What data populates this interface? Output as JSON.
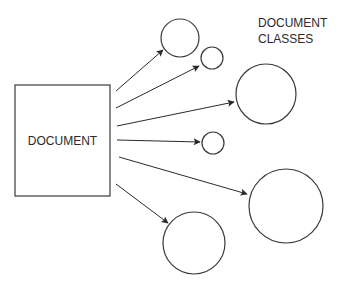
{
  "diagram": {
    "source_node": {
      "label": "DOCUMENT",
      "x": 15,
      "y": 85,
      "width": 95,
      "height": 111
    },
    "classes_title": {
      "line1": "DOCUMENT",
      "line2": "CLASSES"
    },
    "classes": [
      {
        "id": "A",
        "cx": 180,
        "cy": 38,
        "r": 19
      },
      {
        "id": "B",
        "cx": 212,
        "cy": 58,
        "r": 11
      },
      {
        "id": "C",
        "cx": 266,
        "cy": 94,
        "r": 30
      },
      {
        "id": "D",
        "cx": 213,
        "cy": 143,
        "r": 11
      },
      {
        "id": "E",
        "cx": 286,
        "cy": 206,
        "r": 37
      },
      {
        "id": "F",
        "cx": 194,
        "cy": 243,
        "r": 31
      }
    ],
    "arrows": [
      {
        "from": [
          116,
          91
        ],
        "to": [
          163,
          50
        ]
      },
      {
        "from": [
          116,
          108
        ],
        "to": [
          199,
          66
        ]
      },
      {
        "from": [
          117,
          126
        ],
        "to": [
          234,
          102
        ]
      },
      {
        "from": [
          117,
          140
        ],
        "to": [
          200,
          142
        ]
      },
      {
        "from": [
          119,
          157
        ],
        "to": [
          247,
          194
        ]
      },
      {
        "from": [
          116,
          184
        ],
        "to": [
          168,
          223
        ]
      }
    ],
    "colors": {
      "stroke": "#3a3a3a",
      "text": "#2a2a2a",
      "background": "#ffffff"
    }
  }
}
